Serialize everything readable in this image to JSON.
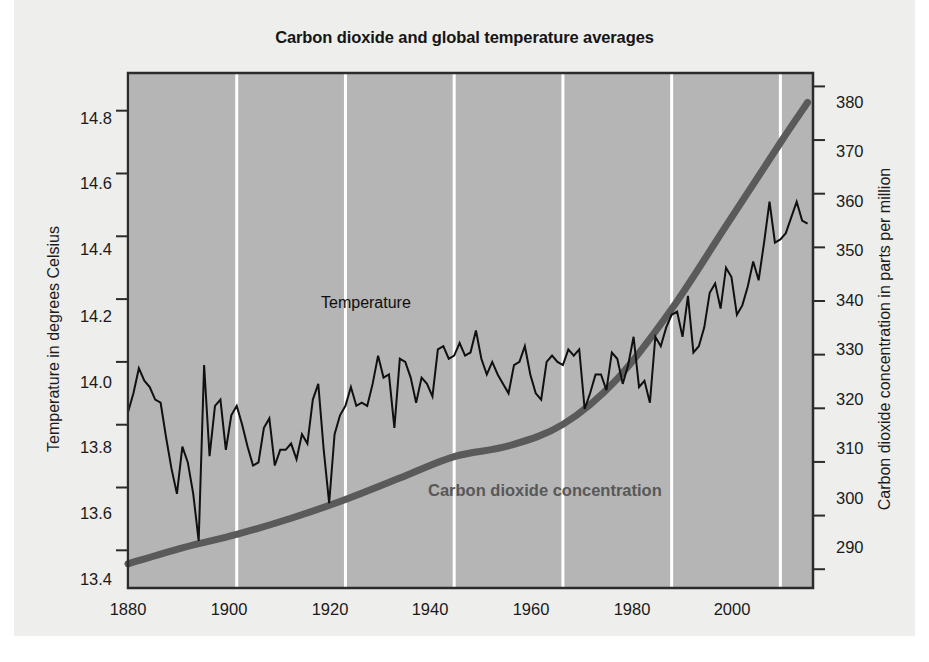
{
  "title": "Carbon dioxide and global temperature averages",
  "series_labels": {
    "temperature": "Temperature",
    "co2": "Carbon dioxide concentration"
  },
  "axes": {
    "left_title": "Temperature  in degrees Celsius",
    "right_title": "Carbon dioxide concentration in parts per million",
    "left_ticks": [
      "14.8",
      "14.6",
      "14.4",
      "14.2",
      "14.0",
      "13.8",
      "13.6",
      "13.4"
    ],
    "right_ticks": [
      "380",
      "370",
      "360",
      "350",
      "340",
      "330",
      "320",
      "310",
      "300",
      "290"
    ],
    "x_ticks": [
      "1880",
      "1900",
      "1920",
      "1940",
      "1960",
      "1980",
      "2000"
    ]
  },
  "colors": {
    "plot_background": "#b5b5b5",
    "paper_background": "#eeeeec",
    "gridline": "#ffffff",
    "temperature_line": "#101010",
    "co2_line": "#5a5a5a",
    "axis_border": "#2b2b2b",
    "title_text": "#151515"
  },
  "chart_data": {
    "type": "line",
    "title": "Carbon dioxide and global temperature averages",
    "xlabel": "",
    "ylabel": "Temperature  in degrees Celsius",
    "y2label": "Carbon dioxide concentration in parts per million",
    "xlim": [
      1880,
      2006
    ],
    "ylim": [
      13.28,
      14.92
    ],
    "y2lim": [
      286.5,
      382.5
    ],
    "grid": "vertical-only, white lines at each 20-year tick",
    "legend": "inline labels on plot",
    "series": [
      {
        "name": "Temperature",
        "axis": "left",
        "units": "degrees Celsius",
        "style": "thin jagged black line, annual values",
        "x": [
          1880,
          1881,
          1882,
          1883,
          1884,
          1885,
          1886,
          1887,
          1888,
          1889,
          1890,
          1891,
          1892,
          1893,
          1894,
          1895,
          1896,
          1897,
          1898,
          1899,
          1900,
          1901,
          1902,
          1903,
          1904,
          1905,
          1906,
          1907,
          1908,
          1909,
          1910,
          1911,
          1912,
          1913,
          1914,
          1915,
          1916,
          1917,
          1918,
          1919,
          1920,
          1921,
          1922,
          1923,
          1924,
          1925,
          1926,
          1927,
          1928,
          1929,
          1930,
          1931,
          1932,
          1933,
          1934,
          1935,
          1936,
          1937,
          1938,
          1939,
          1940,
          1941,
          1942,
          1943,
          1944,
          1945,
          1946,
          1947,
          1948,
          1949,
          1950,
          1951,
          1952,
          1953,
          1954,
          1955,
          1956,
          1957,
          1958,
          1959,
          1960,
          1961,
          1962,
          1963,
          1964,
          1965,
          1966,
          1967,
          1968,
          1969,
          1970,
          1971,
          1972,
          1973,
          1974,
          1975,
          1976,
          1977,
          1978,
          1979,
          1980,
          1981,
          1982,
          1983,
          1984,
          1985,
          1986,
          1987,
          1988,
          1989,
          1990,
          1991,
          1992,
          1993,
          1994,
          1995,
          1996,
          1997,
          1998,
          1999,
          2000,
          2001,
          2002,
          2003,
          2004,
          2005
        ],
        "values": [
          13.84,
          13.9,
          13.98,
          13.94,
          13.92,
          13.88,
          13.87,
          13.76,
          13.66,
          13.58,
          13.73,
          13.68,
          13.58,
          13.43,
          13.99,
          13.7,
          13.86,
          13.88,
          13.72,
          13.83,
          13.86,
          13.8,
          13.73,
          13.67,
          13.68,
          13.79,
          13.82,
          13.67,
          13.72,
          13.72,
          13.74,
          13.69,
          13.77,
          13.74,
          13.88,
          13.93,
          13.72,
          13.55,
          13.77,
          13.83,
          13.86,
          13.92,
          13.86,
          13.87,
          13.86,
          13.93,
          14.02,
          13.95,
          13.96,
          13.79,
          14.01,
          14.0,
          13.95,
          13.87,
          13.95,
          13.93,
          13.89,
          14.04,
          14.05,
          14.01,
          14.02,
          14.06,
          14.02,
          14.03,
          14.1,
          14.01,
          13.96,
          14.0,
          13.96,
          13.93,
          13.9,
          13.99,
          14.0,
          14.05,
          13.96,
          13.9,
          13.88,
          14.0,
          14.02,
          14.0,
          13.99,
          14.04,
          14.02,
          14.04,
          13.85,
          13.9,
          13.96,
          13.96,
          13.91,
          14.03,
          14.01,
          13.93,
          13.99,
          14.08,
          13.92,
          13.94,
          13.87,
          14.08,
          14.05,
          14.11,
          14.15,
          14.16,
          14.08,
          14.21,
          14.03,
          14.05,
          14.11,
          14.22,
          14.25,
          14.17,
          14.3,
          14.27,
          14.15,
          14.18,
          14.24,
          14.32,
          14.26,
          14.38,
          14.51,
          14.38,
          14.39,
          14.41,
          14.46,
          14.51,
          14.45,
          14.44
        ]
      },
      {
        "name": "Carbon dioxide concentration",
        "axis": "right",
        "units": "parts per million",
        "style": "thick smooth gray curve",
        "x": [
          1880,
          1890,
          1900,
          1910,
          1920,
          1930,
          1940,
          1950,
          1960,
          1970,
          1980,
          1990,
          2000,
          2005
        ],
        "values": [
          291.0,
          294.0,
          296.5,
          299.5,
          303.0,
          307.0,
          311.0,
          313.0,
          317.0,
          325.5,
          338.5,
          354.0,
          369.5,
          377.0
        ]
      }
    ]
  }
}
